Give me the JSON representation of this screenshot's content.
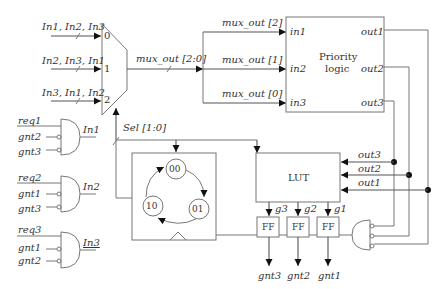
{
  "mux": {
    "inputs": [
      {
        "label": "In1, In2, In3",
        "port": "0"
      },
      {
        "label": "In2, In3, In1",
        "port": "1"
      },
      {
        "label": "In3, In1, In2",
        "port": "2"
      }
    ],
    "output_label": "mux_out [2:0]",
    "select_label": "Sel [1:0]"
  },
  "branches": [
    {
      "label": "mux_out [2]",
      "port": "in1"
    },
    {
      "label": "mux_out [1]",
      "port": "in2"
    },
    {
      "label": "mux_out [0]",
      "port": "in3"
    }
  ],
  "priority_logic": {
    "title_line1": "Priority",
    "title_line2": "logic",
    "inputs": [
      "in1",
      "in2",
      "in3"
    ],
    "outputs": [
      "out1",
      "out2",
      "out3"
    ]
  },
  "request_gates": [
    {
      "inputs": [
        "req1",
        "gnt2",
        "gnt3"
      ],
      "output": "In1"
    },
    {
      "inputs": [
        "req2",
        "gnt1",
        "gnt3"
      ],
      "output": "In2"
    },
    {
      "inputs": [
        "req3",
        "gnt1",
        "gnt2"
      ],
      "output": "In3"
    }
  ],
  "counter": {
    "states": [
      "00",
      "01",
      "10"
    ]
  },
  "lut": {
    "label": "LUT",
    "inputs": [
      "out3",
      "out2",
      "out1"
    ],
    "outputs": [
      "g3",
      "g2",
      "g1"
    ]
  },
  "flipflops": [
    {
      "label": "FF",
      "output": "gnt3"
    },
    {
      "label": "FF",
      "output": "gnt2"
    },
    {
      "label": "FF",
      "output": "gnt1"
    }
  ]
}
